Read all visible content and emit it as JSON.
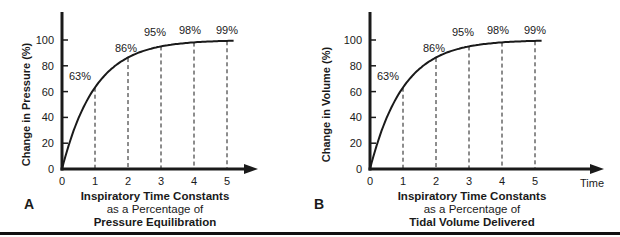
{
  "chart_data": [
    {
      "type": "line",
      "panel_label": "A",
      "title": "",
      "xlabel": "Inspiratory Time Constants as a Percentage of Pressure Equilibration",
      "xlabel_lines": [
        "Inspiratory Time Constants",
        "as a Percentage of",
        "Pressure Equilibration"
      ],
      "ylabel": "Change in Pressure (%)",
      "x_ticks": [
        0,
        1,
        2,
        3,
        4,
        5
      ],
      "y_ticks": [
        0,
        20,
        40,
        60,
        80,
        100
      ],
      "xlim": [
        0,
        5.2
      ],
      "ylim": [
        0,
        100
      ],
      "x_end_label": "",
      "series": [
        {
          "name": "Pressure equilibration",
          "x": [
            0,
            1,
            2,
            3,
            4,
            5
          ],
          "values": [
            0,
            63,
            86,
            95,
            98,
            99
          ]
        }
      ],
      "annotations": [
        "63%",
        "86%",
        "95%",
        "98%",
        "99%"
      ],
      "dashed_verticals_at": [
        1,
        2,
        3,
        4,
        5
      ],
      "grid": false
    },
    {
      "type": "line",
      "panel_label": "B",
      "title": "",
      "xlabel": "Inspiratory Time Constants as a Percentage of Tidal Volume Delivered",
      "xlabel_lines": [
        "Inspiratory Time Constants",
        "as a Percentage of",
        "Tidal Volume Delivered"
      ],
      "ylabel": "Change in Volume (%)",
      "x_ticks": [
        0,
        1,
        2,
        3,
        4,
        5
      ],
      "y_ticks": [
        0,
        20,
        40,
        60,
        80,
        100
      ],
      "xlim": [
        0,
        5.2
      ],
      "ylim": [
        0,
        100
      ],
      "x_end_label": "Time",
      "series": [
        {
          "name": "Tidal volume delivered",
          "x": [
            0,
            1,
            2,
            3,
            4,
            5
          ],
          "values": [
            0,
            63,
            86,
            95,
            98,
            99
          ]
        }
      ],
      "annotations": [
        "63%",
        "86%",
        "95%",
        "98%",
        "99%"
      ],
      "dashed_verticals_at": [
        1,
        2,
        3,
        4,
        5
      ],
      "grid": false
    }
  ],
  "panels": {
    "a": {
      "letter": "A",
      "ylabel": "Change in Pressure (%)",
      "caption_line1": "Inspiratory Time Constants",
      "caption_line2": "as a Percentage of",
      "caption_line3": "Pressure Equilibration"
    },
    "b": {
      "letter": "B",
      "ylabel": "Change in Volume (%)",
      "time_label": "Time",
      "caption_line1": "Inspiratory Time Constants",
      "caption_line2": "as a Percentage of",
      "caption_line3": "Tidal Volume Delivered"
    }
  },
  "colors": {
    "ink": "#1a1a1a",
    "background": "#ffffff"
  }
}
